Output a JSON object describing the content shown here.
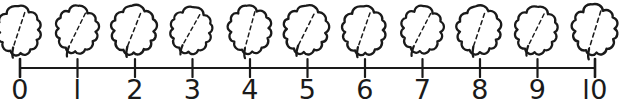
{
  "worksheet": {
    "title": "Leaf counting number line",
    "background_color": "#ffffff",
    "ink_color": "#1a1a1a",
    "width": 642,
    "height": 107
  },
  "number_line": {
    "name": "number-line",
    "axis_color": "#1a1a1a",
    "axis_y": 12,
    "axis_start_x": 20,
    "axis_end_x": 595,
    "tick_spacing": 57.5,
    "tick_half_height": 9,
    "tick_count": 11,
    "labels": [
      "0",
      "l",
      "2",
      "3",
      "4",
      "5",
      "6",
      "7",
      "8",
      "9",
      "l0"
    ],
    "values": [
      0,
      1,
      2,
      3,
      4,
      5,
      6,
      7,
      8,
      9,
      10
    ]
  },
  "leaves": {
    "name": "leaf-icons",
    "count": 11,
    "icon": "leaf-icon",
    "outline_color": "#1a1a1a",
    "fill_color": "#ffffff",
    "vein_style": "dashed",
    "items": [
      {
        "label": "leaf-0",
        "x": 20,
        "rotate": -4,
        "scale": 1.0,
        "variant": 0
      },
      {
        "label": "leaf-1",
        "x": 77,
        "rotate": 5,
        "scale": 0.97,
        "variant": 1
      },
      {
        "label": "leaf-2",
        "x": 135,
        "rotate": -2,
        "scale": 1.02,
        "variant": 2
      },
      {
        "label": "leaf-3",
        "x": 192,
        "rotate": 7,
        "scale": 0.95,
        "variant": 0
      },
      {
        "label": "leaf-4",
        "x": 250,
        "rotate": -6,
        "scale": 0.98,
        "variant": 1
      },
      {
        "label": "leaf-5",
        "x": 307,
        "rotate": 3,
        "scale": 1.01,
        "variant": 2
      },
      {
        "label": "leaf-6",
        "x": 365,
        "rotate": -3,
        "scale": 0.99,
        "variant": 0
      },
      {
        "label": "leaf-7",
        "x": 422,
        "rotate": 6,
        "scale": 0.96,
        "variant": 1
      },
      {
        "label": "leaf-8",
        "x": 480,
        "rotate": -5,
        "scale": 1.0,
        "variant": 2
      },
      {
        "label": "leaf-9",
        "x": 537,
        "rotate": 4,
        "scale": 0.97,
        "variant": 0
      },
      {
        "label": "leaf-10",
        "x": 595,
        "rotate": -4,
        "scale": 1.03,
        "variant": 1
      }
    ]
  }
}
